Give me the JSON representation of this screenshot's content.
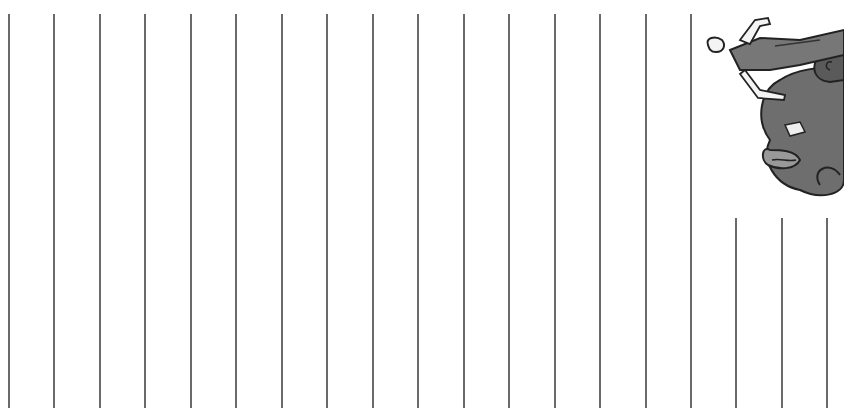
{
  "page": {
    "background": "#ffffff",
    "line_color": "#6a6a6a"
  },
  "lines": {
    "full_height": [
      8,
      53,
      99,
      144,
      190,
      235,
      281,
      326,
      372,
      417,
      463,
      508,
      554,
      599,
      645,
      690
    ],
    "full_top": 14,
    "short": [
      735,
      781,
      826
    ],
    "short_top": 218
  },
  "illustration": {
    "description": "cartoon figure lying on curly dark hair, grayscale",
    "icon": "cartoon-figure"
  }
}
